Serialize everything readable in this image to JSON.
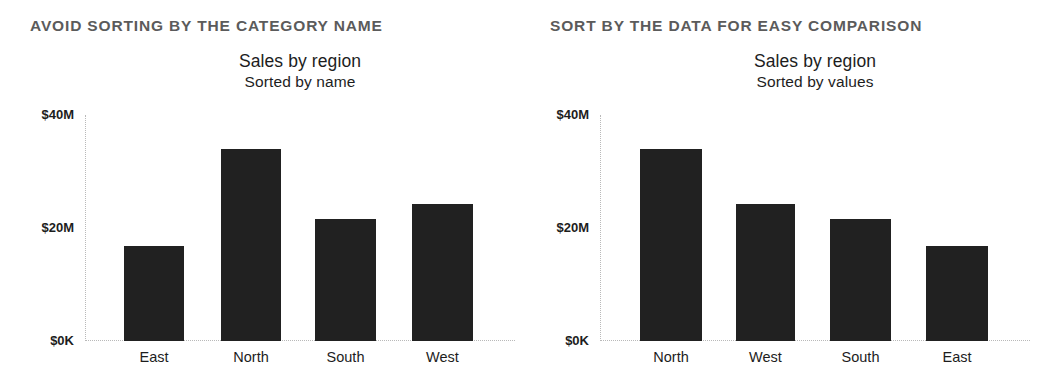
{
  "panels": [
    {
      "heading": "AVOID SORTING BY THE CATEGORY NAME",
      "title": "Sales by region",
      "subtitle": "Sorted by name"
    },
    {
      "heading": "SORT BY THE DATA FOR EASY COMPARISON",
      "title": "Sales by region",
      "subtitle": "Sorted by values"
    }
  ],
  "axis": {
    "ytick_top": "$40M",
    "ytick_mid": "$20M",
    "ytick_bottom": "$0K"
  },
  "colors": {
    "bar": "#212121",
    "heading": "#5b5b5b",
    "text": "#1d1d1d",
    "axis": "#b9b9b9",
    "background": "#ffffff"
  },
  "chart_data": [
    {
      "type": "bar",
      "title": "Sales by region",
      "subtitle": "Sorted by name",
      "xlabel": "",
      "ylabel": "",
      "ylim": [
        0,
        40
      ],
      "yunit": "$M",
      "ytick_labels": [
        "$0K",
        "$20M",
        "$40M"
      ],
      "ytick_values": [
        0,
        20,
        40
      ],
      "grid": false,
      "legend": "none",
      "sorted_by": "category name",
      "categories": [
        "East",
        "North",
        "South",
        "West"
      ],
      "values": [
        16.8,
        34.0,
        21.6,
        24.2
      ]
    },
    {
      "type": "bar",
      "title": "Sales by region",
      "subtitle": "Sorted by values",
      "xlabel": "",
      "ylabel": "",
      "ylim": [
        0,
        40
      ],
      "yunit": "$M",
      "ytick_labels": [
        "$0K",
        "$20M",
        "$40M"
      ],
      "ytick_values": [
        0,
        20,
        40
      ],
      "grid": false,
      "legend": "none",
      "sorted_by": "value descending",
      "categories": [
        "North",
        "West",
        "South",
        "East"
      ],
      "values": [
        34.0,
        24.2,
        21.6,
        16.8
      ]
    }
  ]
}
